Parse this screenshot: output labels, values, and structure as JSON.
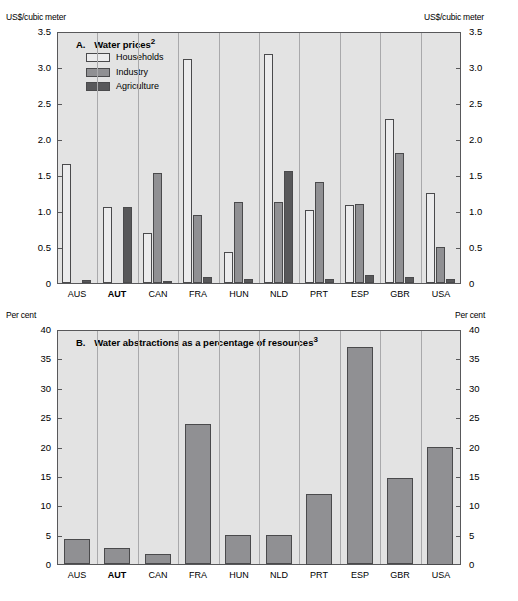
{
  "chart_data": [
    {
      "type": "bar",
      "panel": "A",
      "title": "Water prices",
      "title_superscript": "2",
      "ylabel": "US$/cubic meter",
      "ylabel_right": "US$/cubic meter",
      "xlabel": "",
      "ylim": [
        0,
        3.5
      ],
      "yticks": [
        "0",
        "0.5",
        "1.0",
        "1.5",
        "2.0",
        "2.5",
        "3.0",
        "3.5"
      ],
      "ytick_values": [
        0,
        0.5,
        1.0,
        1.5,
        2.0,
        2.5,
        3.0,
        3.5
      ],
      "grid": false,
      "legend_position": "top-left",
      "highlight_category": "AUT",
      "categories": [
        "AUS",
        "AUT",
        "CAN",
        "FRA",
        "HUN",
        "NLD",
        "PRT",
        "ESP",
        "GBR",
        "USA"
      ],
      "series": [
        {
          "name": "Households",
          "color": "#ececed",
          "values": [
            1.65,
            1.05,
            0.7,
            3.11,
            0.43,
            3.18,
            1.01,
            1.08,
            2.28,
            1.25
          ]
        },
        {
          "name": "Industry",
          "color": "#909093",
          "values": [
            0.0,
            0.0,
            1.53,
            0.94,
            1.13,
            1.13,
            1.4,
            1.1,
            1.81,
            0.5
          ]
        },
        {
          "name": "Agriculture",
          "color": "#58585a",
          "values": [
            0.04,
            1.05,
            0.03,
            0.08,
            0.05,
            1.55,
            0.05,
            0.11,
            0.08,
            0.06
          ]
        }
      ]
    },
    {
      "type": "bar",
      "panel": "B",
      "title": "Water abstractions as a percentage of resources",
      "title_superscript": "3",
      "ylabel": "Per cent",
      "ylabel_right": "Per cent",
      "xlabel": "",
      "ylim": [
        0,
        40
      ],
      "yticks": [
        "0",
        "5",
        "10",
        "15",
        "20",
        "25",
        "30",
        "35",
        "40"
      ],
      "ytick_values": [
        0,
        5,
        10,
        15,
        20,
        25,
        30,
        35,
        40
      ],
      "grid": false,
      "legend_position": "none",
      "highlight_category": "AUT",
      "categories": [
        "AUS",
        "AUT",
        "CAN",
        "FRA",
        "HUN",
        "NLD",
        "PRT",
        "ESP",
        "GBR",
        "USA"
      ],
      "series": [
        {
          "name": "Water abstractions",
          "color": "#909093",
          "values": [
            4.3,
            2.8,
            1.7,
            23.9,
            5.0,
            4.9,
            12.0,
            36.9,
            14.7,
            20.0
          ]
        }
      ]
    }
  ],
  "panelA": {
    "title_label": "A.",
    "title_text": "Water prices",
    "title_sup": "2",
    "unit_left": "US$/cubic meter",
    "unit_right": "US$/cubic meter",
    "legend": [
      {
        "label": "Households"
      },
      {
        "label": "Industry"
      },
      {
        "label": "Agriculture"
      }
    ]
  },
  "panelB": {
    "title_label": "B.",
    "title_text": "Water abstractions as a percentage of resources",
    "title_sup": "3",
    "unit_left": "Per cent",
    "unit_right": "Per cent"
  }
}
